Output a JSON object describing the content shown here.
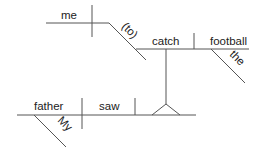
{
  "diagram": {
    "type": "sentence-diagram",
    "sentence_words": {
      "subject": "father",
      "subject_modifier": "My",
      "verb": "saw",
      "infinitive_verb": "catch",
      "infinitive_object": "football",
      "object_modifier": "the",
      "infinitive_subject": "me",
      "infinitive_marker": "(to)"
    },
    "line_color": "#555555",
    "text_color": "#222222"
  }
}
